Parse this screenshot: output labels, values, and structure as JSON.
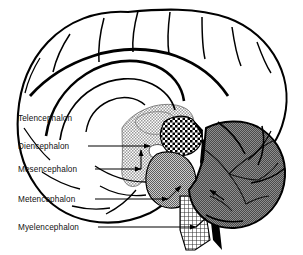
{
  "figure": {
    "background_color": "#ffffff",
    "width": 303,
    "height": 255,
    "view": "midsagittal",
    "style": "black-and-white line drawing with halftone shading"
  },
  "labels": [
    {
      "id": "telencephalon",
      "text": "Telencephalon",
      "x": 18,
      "y": 121,
      "has_leader": false,
      "region_fill": "white",
      "description": "cerebral hemisphere / cerebral cortex"
    },
    {
      "id": "diencephalon",
      "text": "Diencephalon",
      "x": 18,
      "y": 149,
      "has_leader": true,
      "leader_x1": 88,
      "leader_x2": 150,
      "leader_y": 146,
      "region_fill": "light stipple",
      "description": "thalamus and hypothalamus"
    },
    {
      "id": "mesencephalon",
      "text": "Mesencephalon",
      "x": 18,
      "y": 172,
      "has_leader": true,
      "leader_x1": 95,
      "leader_x2": 141,
      "leader_y": 169,
      "region_fill": "checkerboard",
      "description": "midbrain"
    },
    {
      "id": "metencephalon",
      "text": "Metencephalon",
      "x": 18,
      "y": 202,
      "has_leader": true,
      "leader_x1": 95,
      "leader_x2": 168,
      "leader_y": 199,
      "region_fill": "medium gray stipple",
      "description": "pons and cerebellum"
    },
    {
      "id": "myelencephalon",
      "text": "Myelencephalon",
      "x": 18,
      "y": 230,
      "has_leader": true,
      "leader_x1": 98,
      "leader_x2": 196,
      "leader_y": 227,
      "region_fill": "fine crosshatch grid",
      "description": "medulla oblongata"
    }
  ],
  "structures": [
    {
      "id": "cerebrum",
      "name": "cerebral hemisphere",
      "shading": "white with outlined gyri and sulci"
    },
    {
      "id": "corpus-callosum",
      "name": "corpus callosum",
      "shading": "white arc outlined in black"
    },
    {
      "id": "thalamus",
      "name": "thalamus / diencephalon",
      "shading": "light stipple"
    },
    {
      "id": "midbrain",
      "name": "midbrain / mesencephalon",
      "shading": "bold checkerboard"
    },
    {
      "id": "pons",
      "name": "pons",
      "shading": "medium gray stipple"
    },
    {
      "id": "cerebellum",
      "name": "cerebellum",
      "shading": "dark gray stipple with arbor vitae branches"
    },
    {
      "id": "medulla",
      "name": "medulla oblongata",
      "shading": "fine crosshatch grid"
    },
    {
      "id": "tentorium-wedge",
      "name": "fourth ventricle / tentorium wedge",
      "shading": "solid black"
    }
  ],
  "colors": {
    "ink": "#000000",
    "background": "#ffffff",
    "cerebellum_gray": "#6e6e6e",
    "pons_gray": "#8a8a8a",
    "diencephalon_gray": "#d2d2d2",
    "text": "#111111"
  }
}
